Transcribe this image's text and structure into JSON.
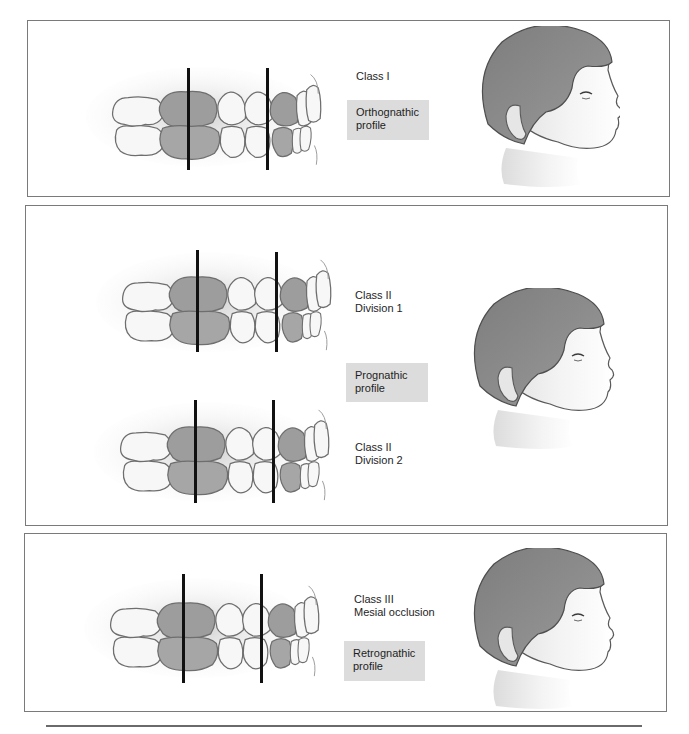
{
  "figure": {
    "panels": [
      {
        "id": "class-1",
        "class_label": "Class I",
        "profile_label": "Orthognathic\nprofile",
        "profile_type": "orthognathic",
        "teeth_sets": 1
      },
      {
        "id": "class-2",
        "class_labels": [
          "Class II\nDivision 1",
          "Class II\nDivision 2"
        ],
        "profile_label": "Prognathic\nprofile",
        "profile_type": "prognathic",
        "teeth_sets": 2
      },
      {
        "id": "class-3",
        "class_label": "Class III\nMesial occlusion",
        "profile_label": "Retrognathic\nprofile",
        "profile_type": "retrognathic",
        "teeth_sets": 1
      }
    ],
    "colors": {
      "panel_border": "#7a7a7a",
      "label_box": "#dcdcdc",
      "hair": "#8a8a8a",
      "skin": "#f0f0f0",
      "tooth_highlight": "#9a9a9a",
      "tooth_white": "#f7f7f7",
      "reference_line": "#111111"
    }
  }
}
